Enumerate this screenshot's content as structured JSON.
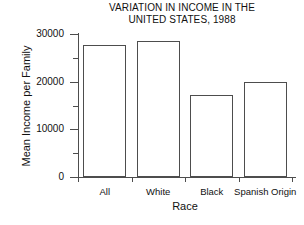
{
  "chart_data": {
    "type": "bar",
    "title": "VARIATION IN INCOME IN THE UNITED STATES, 1988",
    "title_lines": [
      "VARIATION IN INCOME IN THE",
      "UNITED STATES, 1988"
    ],
    "xlabel": "Race",
    "ylabel": "Mean Income per Family",
    "categories": [
      "All",
      "White",
      "Black",
      "Spanish Origin"
    ],
    "values": [
      27700,
      28500,
      17300,
      20000
    ],
    "ylim": [
      0,
      30000
    ],
    "ytick_labels": [
      "0",
      "10000",
      "20000",
      "30000"
    ],
    "ytick_values": [
      0,
      10000,
      20000,
      30000
    ],
    "yminor_values": [
      5000,
      15000,
      25000
    ],
    "grid": false,
    "legend": "none",
    "bar_fill": "#ffffff",
    "bar_edge": "#4d4d4d",
    "axis_color": "#4d4d4d",
    "background": "#ffffff"
  }
}
